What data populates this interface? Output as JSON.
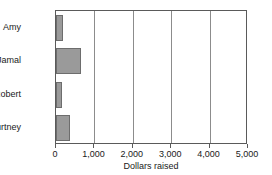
{
  "chart_data": {
    "type": "bar",
    "orientation": "horizontal",
    "title": "",
    "xlabel": "Dollars raised",
    "ylabel": "",
    "categories": [
      "Amy",
      "Jamal",
      "Robert",
      "Courtney"
    ],
    "values": [
      180,
      650,
      150,
      370
    ],
    "xlim": [
      0,
      5000
    ],
    "xticks": [
      0,
      1000,
      2000,
      3000,
      4000,
      5000
    ],
    "xticklabels": [
      "0",
      "1,000",
      "2,000",
      "3,000",
      "4,000",
      "5,000"
    ],
    "grid": "vertical",
    "legend": "none",
    "bar_color": "#9a9a9a",
    "bar_edge_color": "#6d6d6d",
    "frame_color": "#5a5a5a",
    "gridline_color": "#8c8c8c",
    "background": "#ffffff"
  }
}
